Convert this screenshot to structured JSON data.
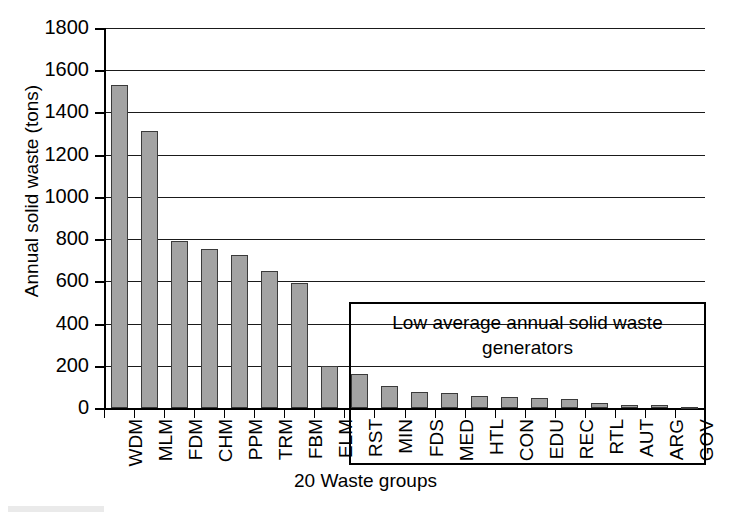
{
  "chart_data": {
    "type": "bar",
    "title": "",
    "xlabel": "20 Waste groups",
    "ylabel": "Annual solid waste (tons)",
    "ylim": [
      0,
      1800
    ],
    "ytick_step": 200,
    "yticks": [
      0,
      200,
      400,
      600,
      800,
      1000,
      1200,
      1400,
      1600,
      1800
    ],
    "ytick_labels": [
      "0",
      "200",
      "400",
      "600",
      "800",
      "1000",
      "1200",
      "1400",
      "1600",
      "1800"
    ],
    "grid": "horizontal",
    "legend": "none",
    "bar_color": "#a3a3a3",
    "bar_edge_color": "#3a3a3a",
    "categories": [
      "WDM",
      "MLM",
      "FDM",
      "CHM",
      "PPM",
      "TRM",
      "FBM",
      "ELM",
      "RST",
      "MIN",
      "FDS",
      "MED",
      "HTL",
      "CON",
      "EDU",
      "REC",
      "RTL",
      "AUT",
      "ARG",
      "GOV"
    ],
    "values": [
      1530,
      1310,
      790,
      755,
      725,
      650,
      590,
      200,
      160,
      105,
      75,
      70,
      55,
      50,
      48,
      45,
      22,
      13,
      14,
      3
    ],
    "annotations": [
      {
        "text": "Low average annual solid waste generators",
        "line1": "Low average annual solid waste",
        "line2": "generators",
        "covers_categories": [
          "RST",
          "MIN",
          "FDS",
          "MED",
          "HTL",
          "CON",
          "EDU",
          "REC",
          "RTL",
          "AUT",
          "ARG",
          "GOV"
        ],
        "style": "rectangle-box"
      }
    ]
  },
  "axes": {
    "ylabel": "Annual solid waste (tons)",
    "xlabel": "20 Waste groups"
  },
  "callout": {
    "line1": "Low average annual solid waste",
    "line2": "generators"
  }
}
